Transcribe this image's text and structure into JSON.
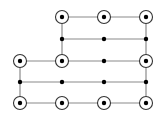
{
  "diagram": {
    "title": "",
    "colors": {
      "background": "#ffffff",
      "edge": "#8a8a8a",
      "node_fill": "#000000",
      "ring": "#333333"
    },
    "columns_x": [
      20,
      62,
      104,
      146
    ],
    "rows_y": [
      17,
      39,
      61,
      82,
      103
    ],
    "nodes": [
      {
        "id": "r0c1",
        "row": 0,
        "col": 1,
        "type": "circled"
      },
      {
        "id": "r0c2",
        "row": 0,
        "col": 2,
        "type": "circled"
      },
      {
        "id": "r0c3",
        "row": 0,
        "col": 3,
        "type": "circled"
      },
      {
        "id": "r1c1",
        "row": 1,
        "col": 1,
        "type": "dot"
      },
      {
        "id": "r1c2",
        "row": 1,
        "col": 2,
        "type": "dot"
      },
      {
        "id": "r1c3",
        "row": 1,
        "col": 3,
        "type": "dot"
      },
      {
        "id": "r2c0",
        "row": 2,
        "col": 0,
        "type": "circled"
      },
      {
        "id": "r2c1",
        "row": 2,
        "col": 1,
        "type": "circled"
      },
      {
        "id": "r2c2",
        "row": 2,
        "col": 2,
        "type": "dot"
      },
      {
        "id": "r2c3",
        "row": 2,
        "col": 3,
        "type": "circled"
      },
      {
        "id": "r3c0",
        "row": 3,
        "col": 0,
        "type": "dot"
      },
      {
        "id": "r3c1",
        "row": 3,
        "col": 1,
        "type": "dot"
      },
      {
        "id": "r3c2",
        "row": 3,
        "col": 2,
        "type": "dot"
      },
      {
        "id": "r3c3",
        "row": 3,
        "col": 3,
        "type": "dot"
      },
      {
        "id": "r4c0",
        "row": 4,
        "col": 0,
        "type": "circled"
      },
      {
        "id": "r4c1",
        "row": 4,
        "col": 1,
        "type": "circled"
      },
      {
        "id": "r4c2",
        "row": 4,
        "col": 2,
        "type": "circled"
      },
      {
        "id": "r4c3",
        "row": 4,
        "col": 3,
        "type": "circled"
      }
    ],
    "edges": [
      {
        "from": "r0c1",
        "to": "r0c3"
      },
      {
        "from": "r1c1",
        "to": "r1c3"
      },
      {
        "from": "r2c0",
        "to": "r2c3"
      },
      {
        "from": "r3c0",
        "to": "r3c3"
      },
      {
        "from": "r4c0",
        "to": "r4c3"
      },
      {
        "from": "r0c1",
        "to": "r2c1"
      },
      {
        "from": "r0c3",
        "to": "r4c3"
      },
      {
        "from": "r2c0",
        "to": "r4c0"
      }
    ]
  }
}
